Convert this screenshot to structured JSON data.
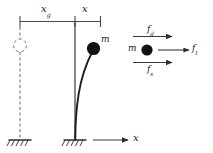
{
  "figure": {
    "kind": "structural-dynamics-sdof-diagram",
    "colors": {
      "ink": "#1a1a1a",
      "line": "#3a3a3a",
      "mass_fill": "#111111",
      "dashed": "#555555",
      "background": "#ffffff"
    }
  },
  "dimensions": {
    "ground_displacement": {
      "symbol": "x",
      "subscript": "g",
      "text": "x"
    },
    "relative_displacement": {
      "symbol": "x",
      "subscript": "",
      "text": "x"
    }
  },
  "structure": {
    "mass_label": {
      "text": "m"
    },
    "undeformed_note": "dashed column with dashed mass outline",
    "deformed_note": "curved cantilever column with solid mass"
  },
  "axis": {
    "label": {
      "text": "x"
    }
  },
  "free_body": {
    "mass_label": {
      "text": "m"
    },
    "forces": [
      {
        "name": "damping-force",
        "symbol": "f",
        "subscript": "d",
        "text": "f",
        "direction": "right",
        "position": "top"
      },
      {
        "name": "inertia-force",
        "symbol": "f",
        "subscript": "I",
        "text": "f",
        "direction": "right",
        "position": "right"
      },
      {
        "name": "spring-force",
        "symbol": "f",
        "subscript": "s",
        "text": "f",
        "direction": "right",
        "position": "bottom"
      }
    ]
  }
}
